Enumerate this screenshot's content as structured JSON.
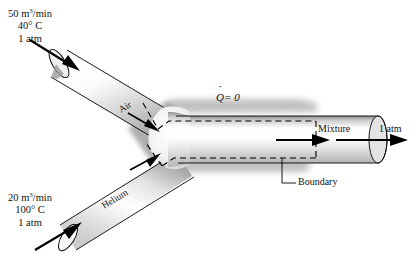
{
  "figure": {
    "type": "thermodynamics-schematic",
    "background_color": "#ffffff",
    "line_color": "#000000"
  },
  "inlets": [
    {
      "id": "air",
      "pipe_label": "Air",
      "flow_rate": "50 m³/min",
      "temperature": "40° C",
      "pressure": "1 atm",
      "position": "upper-left"
    },
    {
      "id": "helium",
      "pipe_label": "Helium",
      "flow_rate": "20 m³/min",
      "temperature": "100° C",
      "pressure": "1 atm",
      "position": "lower-left"
    }
  ],
  "outlet": {
    "id": "mixture",
    "pipe_label": "Mixture",
    "pressure": "1 atm",
    "position": "right"
  },
  "annotations": {
    "heat_transfer_symbol": "Q",
    "heat_transfer_value": "= 0",
    "boundary_label": "Boundary"
  },
  "colors": {
    "pipe_highlight": "#ffffff",
    "pipe_midtone": "#c9c9c9",
    "pipe_shadow": "#8a8a8a",
    "drop_shadow": "#9a9a9a",
    "outline": "#000000"
  }
}
